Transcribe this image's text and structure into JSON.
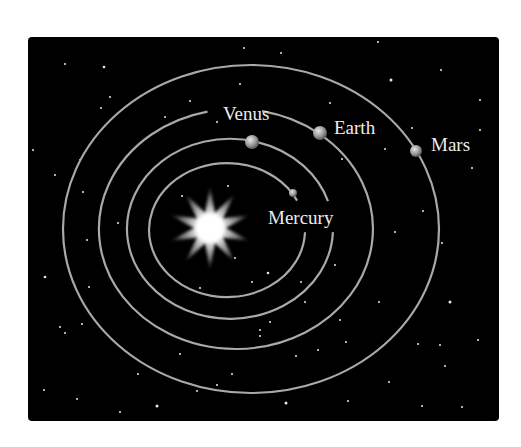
{
  "diagram": {
    "background": {
      "x": 28,
      "y": 37,
      "width": 471,
      "height": 384,
      "radius": 4,
      "color": "#000000"
    },
    "orbit_color": "#a9a9a9",
    "sun": {
      "name": "Sun",
      "cx": 210,
      "cy": 228,
      "points": 10,
      "outer_r": 42,
      "inner_r": 16,
      "color": "#ffffff"
    },
    "orbits": [
      {
        "name": "Mercury",
        "cx": 227,
        "cy": 230,
        "rx": 78,
        "ry": 67,
        "gap_deg": [
          -26,
          2
        ]
      },
      {
        "name": "Venus",
        "cx": 230,
        "cy": 229,
        "rx": 103,
        "ry": 90,
        "gap_deg": [
          -18,
          2
        ]
      },
      {
        "name": "Earth",
        "cx": 236,
        "cy": 229,
        "rx": 137,
        "ry": 120,
        "gap_deg": [
          -102,
          -79
        ]
      },
      {
        "name": "Mars",
        "cx": 251,
        "cy": 229,
        "rx": 188,
        "ry": 164,
        "gap_deg": null
      }
    ],
    "planets": [
      {
        "name": "Mercury",
        "x": 293,
        "y": 193,
        "r": 4,
        "label": "Mercury",
        "label_x": 268,
        "label_y": 224
      },
      {
        "name": "Venus",
        "x": 252,
        "y": 142,
        "r": 7,
        "label": "Venus",
        "label_x": 223,
        "label_y": 120
      },
      {
        "name": "Earth",
        "x": 320,
        "y": 133,
        "r": 7,
        "label": "Earth",
        "label_x": 334,
        "label_y": 134
      },
      {
        "name": "Mars",
        "x": 416,
        "y": 151,
        "r": 6,
        "label": "Mars",
        "label_x": 431,
        "label_y": 151
      }
    ],
    "stars": [
      [
        104,
        67,
        1.3
      ],
      [
        65,
        64,
        1
      ],
      [
        244,
        48,
        1
      ],
      [
        281,
        53,
        1
      ],
      [
        378,
        42,
        1
      ],
      [
        391,
        80,
        1.5
      ],
      [
        441,
        70,
        1
      ],
      [
        480,
        100,
        1
      ],
      [
        110,
        97,
        1
      ],
      [
        101,
        108,
        1
      ],
      [
        190,
        101,
        1
      ],
      [
        240,
        84,
        1
      ],
      [
        33,
        150,
        1
      ],
      [
        55,
        175,
        1
      ],
      [
        80,
        160,
        1
      ],
      [
        165,
        117,
        1
      ],
      [
        217,
        122,
        1
      ],
      [
        330,
        103,
        1
      ],
      [
        385,
        149,
        1
      ],
      [
        412,
        128,
        1
      ],
      [
        472,
        168,
        1
      ],
      [
        480,
        130,
        1
      ],
      [
        423,
        211,
        1
      ],
      [
        442,
        243,
        1
      ],
      [
        395,
        232,
        1
      ],
      [
        342,
        159,
        1
      ],
      [
        83,
        192,
        1
      ],
      [
        118,
        223,
        1
      ],
      [
        87,
        240,
        1
      ],
      [
        45,
        277,
        1.3
      ],
      [
        89,
        287,
        1
      ],
      [
        182,
        196,
        1
      ],
      [
        228,
        186,
        1
      ],
      [
        235,
        258,
        1
      ],
      [
        268,
        273,
        1.3
      ],
      [
        200,
        288,
        1
      ],
      [
        252,
        282,
        1
      ],
      [
        301,
        282,
        1
      ],
      [
        335,
        265,
        1
      ],
      [
        305,
        302,
        1
      ],
      [
        270,
        322,
        1
      ],
      [
        260,
        336,
        1
      ],
      [
        180,
        354,
        1
      ],
      [
        60,
        327,
        1
      ],
      [
        65,
        333,
        1
      ],
      [
        82,
        324,
        1
      ],
      [
        340,
        320,
        1
      ],
      [
        379,
        302,
        1
      ],
      [
        450,
        302,
        1.5
      ],
      [
        478,
        340,
        1
      ],
      [
        418,
        344,
        1
      ],
      [
        440,
        345,
        1
      ],
      [
        445,
        366,
        1
      ],
      [
        389,
        382,
        1
      ],
      [
        346,
        342,
        1
      ],
      [
        296,
        356,
        1
      ],
      [
        232,
        374,
        1
      ],
      [
        217,
        385,
        1
      ],
      [
        138,
        374,
        1
      ],
      [
        197,
        391,
        1
      ],
      [
        44,
        390,
        1
      ],
      [
        77,
        399,
        1
      ],
      [
        157,
        406,
        1.5
      ],
      [
        120,
        412,
        1
      ],
      [
        286,
        403,
        1.5
      ],
      [
        348,
        401,
        1
      ],
      [
        422,
        406,
        1
      ],
      [
        462,
        407,
        1
      ],
      [
        260,
        330,
        1
      ],
      [
        318,
        350,
        1
      ]
    ]
  }
}
